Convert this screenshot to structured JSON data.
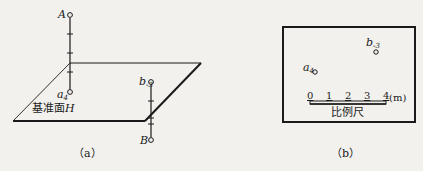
{
  "figure_a": {
    "caption": "（a）",
    "plane_label": "基准面",
    "plane_label_var": "H",
    "point_A": {
      "label": "A"
    },
    "point_a": {
      "label": "a",
      "subscript": "4"
    },
    "point_b": {
      "label": "b",
      "subscript": "-3"
    },
    "point_B": {
      "label": "B"
    }
  },
  "figure_b": {
    "caption": "（b）",
    "point_a": {
      "label": "a",
      "subscript": "4"
    },
    "point_b": {
      "label": "b",
      "subscript": "-3"
    },
    "scale": {
      "ticks": [
        "0",
        "1",
        "2",
        "3",
        "4"
      ],
      "unit": "(m)",
      "label": "比例尺"
    }
  },
  "colors": {
    "ink": "#1a1a1a",
    "paper": "#f2f1ee"
  }
}
